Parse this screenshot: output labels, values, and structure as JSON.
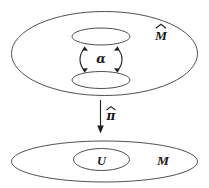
{
  "figure": {
    "caption_text": "",
    "background_color": "#ffffff",
    "stroke_color": "#3b3b42",
    "text_color": "#1a1a1a"
  },
  "upper_region": {
    "outer_label": "M̂",
    "outer_label_plain": "M-hat",
    "inner_top_label": "",
    "inner_bottom_label": "",
    "relation_label": "α",
    "relation_label_plain": "alpha"
  },
  "projection": {
    "label": "π̂",
    "label_plain": "pi-hat",
    "direction": "down"
  },
  "lower_region": {
    "outer_label": "M",
    "inner_label": "U"
  }
}
